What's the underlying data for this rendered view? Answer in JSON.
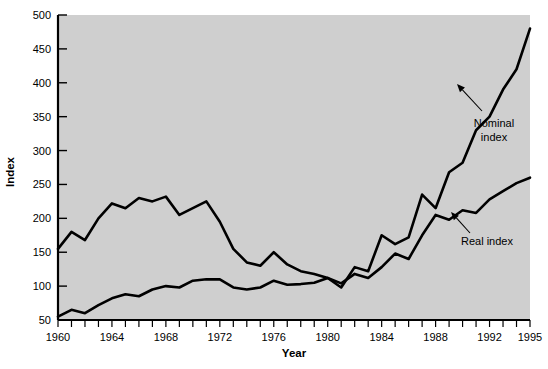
{
  "chart_data": {
    "type": "line",
    "title": "",
    "xlabel": "Year",
    "ylabel": "Index",
    "xlim": [
      1960,
      1995
    ],
    "ylim": [
      50,
      500
    ],
    "grid": false,
    "legend_position": "inline-annotations",
    "x": [
      1960,
      1961,
      1962,
      1963,
      1964,
      1965,
      1966,
      1967,
      1968,
      1969,
      1970,
      1971,
      1972,
      1973,
      1974,
      1975,
      1976,
      1977,
      1978,
      1979,
      1980,
      1981,
      1982,
      1983,
      1984,
      1985,
      1986,
      1987,
      1988,
      1989,
      1990,
      1991,
      1992,
      1993,
      1994,
      1995
    ],
    "x_tick_labels": [
      "1960",
      "1964",
      "1968",
      "1972",
      "1976",
      "1980",
      "1984",
      "1988",
      "1992",
      "1995"
    ],
    "x_tick_values": [
      1960,
      1964,
      1968,
      1972,
      1976,
      1980,
      1984,
      1988,
      1992,
      1995
    ],
    "y_tick_labels": [
      "50",
      "100",
      "150",
      "200",
      "250",
      "300",
      "350",
      "400",
      "450",
      "500"
    ],
    "y_tick_values": [
      50,
      100,
      150,
      200,
      250,
      300,
      350,
      400,
      450,
      500
    ],
    "series": [
      {
        "name": "Nominal index",
        "values": [
          155,
          180,
          168,
          200,
          222,
          215,
          230,
          225,
          232,
          205,
          215,
          225,
          195,
          155,
          135,
          130,
          150,
          132,
          122,
          118,
          112,
          98,
          128,
          122,
          175,
          162,
          172,
          235,
          215,
          268,
          282,
          330,
          350,
          390,
          420,
          480
        ]
      },
      {
        "name": "Real index",
        "values": [
          55,
          65,
          60,
          72,
          82,
          88,
          85,
          95,
          100,
          98,
          108,
          110,
          110,
          98,
          95,
          98,
          108,
          102,
          103,
          105,
          112,
          104,
          118,
          112,
          128,
          148,
          140,
          175,
          205,
          198,
          212,
          208,
          228,
          240,
          252,
          260
        ]
      }
    ],
    "annotations": [
      {
        "name": "nominal-index-annotation",
        "lines": [
          "Nominal",
          "index"
        ],
        "label_x": 494,
        "label_y": 127,
        "arrow_from_x": 482,
        "arrow_from_y": 111,
        "arrow_to_x": 457,
        "arrow_to_y": 84
      },
      {
        "name": "real-index-annotation",
        "lines": [
          "Real index"
        ],
        "label_x": 487,
        "label_y": 245,
        "arrow_from_x": 470,
        "arrow_from_y": 233,
        "arrow_to_x": 451,
        "arrow_to_y": 212
      }
    ],
    "colors": {
      "plot_background": "#cfcfcf",
      "page_background": "#ffffff",
      "line": "#000000",
      "axis": "#000000",
      "text": "#000000"
    }
  }
}
